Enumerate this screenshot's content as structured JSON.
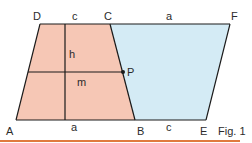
{
  "figure": {
    "caption": "Fig. 1",
    "colors": {
      "trapezoid_fill": "#f6c7b5",
      "parallelogram_fill": "#d4ebf5",
      "stroke": "#1a1a1a",
      "rule": "#e07a3e",
      "text": "#2b2b2b"
    },
    "points": {
      "A": {
        "label": "A",
        "x": 16,
        "y": 120
      },
      "B": {
        "label": "B",
        "x": 135,
        "y": 120
      },
      "C": {
        "label": "C",
        "x": 110,
        "y": 24
      },
      "D": {
        "label": "D",
        "x": 40,
        "y": 24
      },
      "E": {
        "label": "E",
        "x": 206,
        "y": 120
      },
      "F": {
        "label": "F",
        "x": 230,
        "y": 24
      },
      "P": {
        "label": "P",
        "x": 123,
        "y": 72
      }
    },
    "segment_labels": {
      "DC": "c",
      "CF": "a",
      "AB": "a",
      "BE": "c",
      "height": "h",
      "midline": "m"
    }
  }
}
